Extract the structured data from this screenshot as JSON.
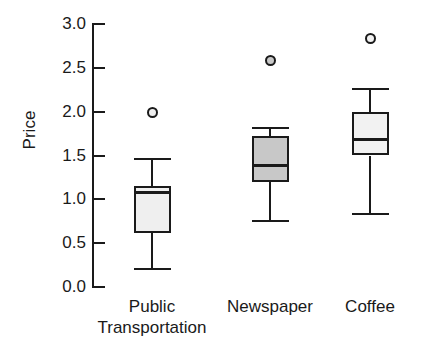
{
  "chart_data": {
    "type": "box",
    "title": "",
    "xlabel": "",
    "ylabel": "Price",
    "ylim": [
      0.0,
      3.0
    ],
    "ytick_labels": [
      "3.0",
      "2.5",
      "2.0",
      "1.5",
      "1.0",
      "0.5",
      "0.0"
    ],
    "ytick_values": [
      3.0,
      2.5,
      2.0,
      1.5,
      1.0,
      0.5,
      0.0
    ],
    "grid": false,
    "legend": "none",
    "categories": [
      "Public\nTransportation",
      "Newspaper",
      "Coffee"
    ],
    "boxes": [
      {
        "category": "Public Transportation",
        "whisker_low": 0.22,
        "q1": 0.62,
        "median": 1.08,
        "q3": 1.15,
        "whisker_high": 1.47,
        "outliers": [
          2.0
        ],
        "fill": "#efefef"
      },
      {
        "category": "Newspaper",
        "whisker_low": 0.76,
        "q1": 1.2,
        "median": 1.39,
        "q3": 1.72,
        "whisker_high": 1.82,
        "outliers": [
          2.59
        ],
        "fill": "#c8c8c8"
      },
      {
        "category": "Coffee",
        "whisker_low": 0.84,
        "q1": 1.5,
        "median": 1.69,
        "q3": 2.0,
        "whisker_high": 2.27,
        "outliers": [
          2.84
        ],
        "fill": "#f2f2f2"
      }
    ]
  },
  "axis": {
    "label_color": "#1a1a1a",
    "line_color": "#1a1a1a"
  }
}
